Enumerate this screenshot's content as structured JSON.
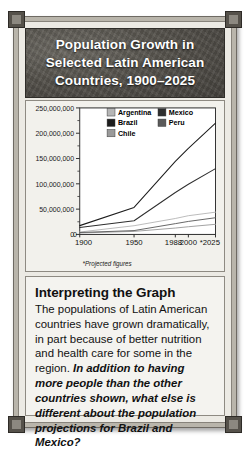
{
  "figure": {
    "title_line_1": "Population Growth in",
    "title_line_2": "Selected Latin American",
    "title_line_3": "Countries, 1900–2025",
    "title_full": "Population Growth in Selected Latin American Countries, 1900–2025"
  },
  "chart_data": {
    "type": "line",
    "title": "Population Growth in Selected Latin American Countries, 1900–2025",
    "xlabel": "",
    "ylabel": "",
    "x": [
      1900,
      1950,
      1988,
      2000,
      2025
    ],
    "x_tick_labels": [
      "1900",
      "1950",
      "1988",
      "2000",
      "*2025"
    ],
    "y_tick_labels": [
      "0",
      "50,000,000",
      "100,000,000",
      "150,000,000",
      "200,000,000",
      "250,000,000"
    ],
    "y_ticks": [
      0,
      50000000,
      100000000,
      150000000,
      200000000,
      250000000
    ],
    "ylim": [
      0,
      250000000
    ],
    "grid": false,
    "legend_position": "top-center",
    "footnote": "*Projected figures",
    "series": [
      {
        "name": "Argentina",
        "color": "#b6b6b6",
        "values": [
          4700000,
          17200000,
          31500000,
          37000000,
          44000000
        ]
      },
      {
        "name": "Brazil",
        "color": "#1c1c1c",
        "values": [
          17400000,
          53400000,
          144400000,
          170000000,
          220000000
        ]
      },
      {
        "name": "Chile",
        "color": "#9a9a9a",
        "values": [
          2900000,
          6000000,
          12600000,
          15200000,
          20000000
        ]
      },
      {
        "name": "Mexico",
        "color": "#2e2e2e",
        "values": [
          13600000,
          27000000,
          83000000,
          99000000,
          130000000
        ]
      },
      {
        "name": "Peru",
        "color": "#5a5a5a",
        "values": [
          3800000,
          7600000,
          21300000,
          25700000,
          33000000
        ]
      }
    ]
  },
  "interpreting": {
    "heading": "Interpreting the Graph",
    "body_text": "The populations of Latin American countries have grown dramatically, in part because of better nutrition and health care for some in the region. ",
    "question_text": "In addition to having more people than the other countries shown, what else is different about the population projections for Brazil and Mexico?"
  }
}
